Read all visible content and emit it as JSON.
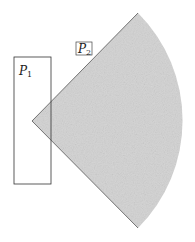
{
  "diagram": {
    "region_p1": {
      "label": "P",
      "subscript": "1",
      "shape": "rectangle",
      "fill": "#ffffff",
      "stroke": "#333333"
    },
    "region_p2": {
      "label": "P",
      "subscript": "2",
      "shape": "circular-sector",
      "fill": "#cfcfcf",
      "stroke": "#444444",
      "label_boxed": true
    }
  }
}
